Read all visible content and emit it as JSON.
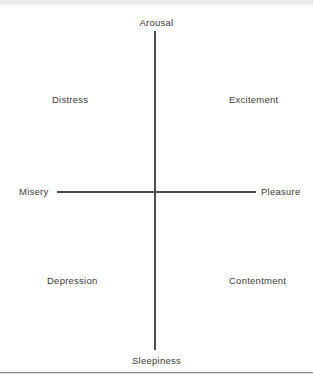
{
  "figure": {
    "type": "circumplex-affect-diagram",
    "axes": {
      "vertical": {
        "top_pole": "Arousal",
        "bottom_pole": "Sleepiness"
      },
      "horizontal": {
        "left_pole": "Misery",
        "right_pole": "Pleasure"
      }
    },
    "quadrant_labels": {
      "upper_left": "Distress",
      "upper_right": "Excitement",
      "lower_left": "Depression",
      "lower_right": "Contentment"
    },
    "colors": {
      "axis_line": "#4d4d4d",
      "label_text": "#3b3b3b",
      "background": "#ffffff",
      "rule": "#8f8f8f"
    }
  },
  "chart_data": {
    "type": "scatter",
    "title": "",
    "xlabel": "",
    "ylabel": "",
    "x_axis": {
      "negative_label": "Misery",
      "positive_label": "Pleasure"
    },
    "y_axis": {
      "negative_label": "Sleepiness",
      "positive_label": "Arousal"
    },
    "grid": false,
    "legend": "none",
    "annotations": [
      {
        "text": "Arousal",
        "position": "top-center",
        "x": 0,
        "y": 1.05
      },
      {
        "text": "Sleepiness",
        "position": "bottom-center",
        "x": 0,
        "y": -1.05
      },
      {
        "text": "Misery",
        "position": "left-middle",
        "x": -1.1,
        "y": 0
      },
      {
        "text": "Pleasure",
        "position": "right-middle",
        "x": 1.1,
        "y": 0
      },
      {
        "text": "Distress",
        "position": "upper-left",
        "x": -0.55,
        "y": 0.6
      },
      {
        "text": "Excitement",
        "position": "upper-right",
        "x": 0.6,
        "y": 0.6
      },
      {
        "text": "Depression",
        "position": "lower-left",
        "x": -0.6,
        "y": -0.55
      },
      {
        "text": "Contentment",
        "position": "lower-right",
        "x": 0.6,
        "y": -0.55
      }
    ],
    "xlim": [
      -1,
      1
    ],
    "ylim": [
      -1,
      1
    ],
    "values": []
  }
}
